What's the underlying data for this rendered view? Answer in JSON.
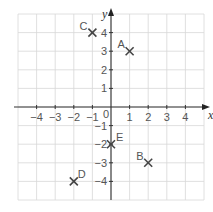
{
  "diagram": {
    "type": "coordinate-grid",
    "x_axis": {
      "label": "x",
      "range": [
        -5,
        5
      ],
      "ticks": [
        -4,
        -3,
        -2,
        -1,
        1,
        2,
        3,
        4
      ]
    },
    "y_axis": {
      "label": "y",
      "range": [
        -5,
        5
      ],
      "ticks": [
        -4,
        -3,
        -2,
        -1,
        1,
        2,
        3,
        4
      ]
    },
    "origin_label": "0",
    "points": [
      {
        "name": "A",
        "x": 1,
        "y": 3
      },
      {
        "name": "B",
        "x": 2,
        "y": -3
      },
      {
        "name": "C",
        "x": -1,
        "y": 4
      },
      {
        "name": "D",
        "x": -2,
        "y": -4
      },
      {
        "name": "E",
        "x": 0,
        "y": -2
      }
    ]
  }
}
